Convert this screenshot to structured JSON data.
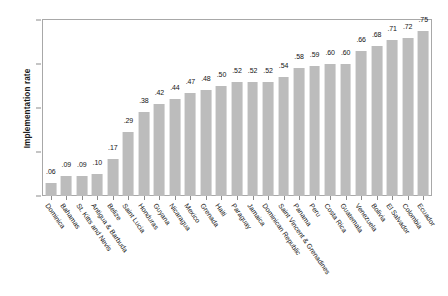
{
  "chart_data": {
    "type": "bar",
    "title": "",
    "xlabel": "",
    "ylabel": "Implementation rate",
    "ylim": [
      0,
      0.8
    ],
    "yticks": [
      ".0",
      ".2",
      ".4",
      ".6",
      ".8"
    ],
    "ytick_values": [
      0,
      0.2,
      0.4,
      0.6,
      0.8
    ],
    "grid": false,
    "legend": "none",
    "bar_color": "#bcbcbc",
    "frame_color": "#a8a8a8",
    "categories": [
      "Dominica",
      "Bahamas",
      "St. Kitts and Nevis",
      "Antigua & Barbuda",
      "Belize",
      "Saint Lucia",
      "Honduras",
      "Guyana",
      "Nicaragua",
      "Mexico",
      "Grenada",
      "Haiti",
      "Paraguay",
      "Jamaica",
      "Dominican Republic",
      "Saint Vincent & Grenadines",
      "Panama",
      "Peru",
      "Costa Rica",
      "Guatemala",
      "Venezuela",
      "Bolivia",
      "El Salvador",
      "Colombia",
      "Ecuador"
    ],
    "values": [
      0.06,
      0.09,
      0.09,
      0.1,
      0.17,
      0.29,
      0.38,
      0.42,
      0.44,
      0.47,
      0.48,
      0.5,
      0.52,
      0.52,
      0.52,
      0.54,
      0.58,
      0.59,
      0.6,
      0.6,
      0.66,
      0.68,
      0.71,
      0.72,
      0.75
    ],
    "value_labels": [
      ".06",
      ".09",
      ".09",
      ".10",
      ".17",
      ".29",
      ".38",
      ".42",
      ".44",
      ".47",
      ".48",
      ".50",
      ".52",
      ".52",
      ".52",
      ".54",
      ".58",
      ".59",
      ".60",
      ".60",
      ".66",
      ".68",
      ".71",
      ".72",
      ".75"
    ]
  },
  "caption": {
    "text": ""
  }
}
